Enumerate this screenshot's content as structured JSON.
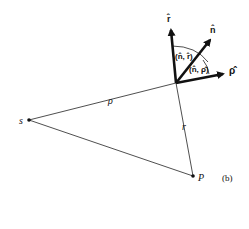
{
  "figure": {
    "panel_label": "(b)",
    "points": {
      "source": "s",
      "field_point": "P"
    },
    "distances": {
      "rho": "ρ",
      "r": "r"
    },
    "unit_vectors": {
      "r_hat": "r̂",
      "n_hat": "n̂",
      "rho_hat": "ρ̂"
    },
    "angles": {
      "n_r": "(n̂, r̂)",
      "n_rho": "(n̂, ρ̂)"
    },
    "colors": {
      "ink": "#111111",
      "background": "#ffffff"
    }
  }
}
